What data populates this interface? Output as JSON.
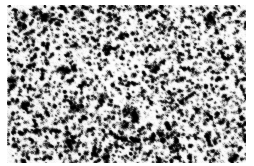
{
  "page": {
    "kind": "micrograph-figure",
    "background_color": "#ffffff",
    "width_px": 254,
    "height_px": 166
  },
  "figure": {
    "name": "histopathology-micrograph",
    "caption": "",
    "modality": "light-microscopy",
    "staining": "grayscale",
    "frame": {
      "left_px": 7,
      "top_px": 5,
      "width_px": 239,
      "height_px": 158,
      "border": "none"
    },
    "appearance": {
      "palette": "grayscale",
      "darkest_color": "#000000",
      "lightest_color": "#ffffff",
      "mean_tone": "#8a8a8a",
      "contrast": "high",
      "texture": "dense-speckled-nuclei",
      "cell_diameter_px": 4.2,
      "cell_density": "very-high",
      "noise_level": 0.42
    },
    "regions": [
      {
        "name": "center-left-pale-zone",
        "cx_px": 112,
        "cy_px": 78,
        "radius_px": 34,
        "relative_brightness": 0.16
      },
      {
        "name": "upper-right-pale-zone",
        "cx_px": 205,
        "cy_px": 30,
        "radius_px": 30,
        "relative_brightness": 0.12
      },
      {
        "name": "lower-left-dark-zone",
        "cx_px": 45,
        "cy_px": 130,
        "radius_px": 38,
        "relative_brightness": -0.08
      },
      {
        "name": "upper-left-dark-zone",
        "cx_px": 35,
        "cy_px": 35,
        "radius_px": 30,
        "relative_brightness": -0.06
      }
    ],
    "seed": 20240517
  }
}
